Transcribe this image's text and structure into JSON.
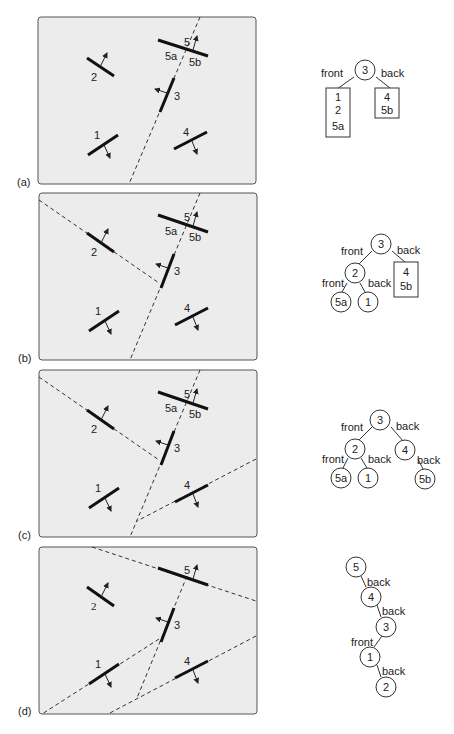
{
  "figure": {
    "panels": [
      {
        "id": "a",
        "label": "(a)",
        "wall_labels": {
          "w1": "1",
          "w2": "2",
          "w3": "3",
          "w4": "4",
          "w5": "5",
          "w5a": "5a",
          "w5b": "5b"
        },
        "tree": {
          "root": "3",
          "front_label": "front",
          "back_label": "back",
          "front_leaf": [
            "1",
            "2",
            "5a"
          ],
          "back_leaf": [
            "4",
            "5b"
          ]
        }
      },
      {
        "id": "b",
        "label": "(b)",
        "wall_labels": {
          "w1": "1",
          "w2": "2",
          "w3": "3",
          "w4": "4",
          "w5": "5",
          "w5a": "5a",
          "w5b": "5b"
        },
        "tree": {
          "root": "3",
          "n2": "2",
          "n5a": "5a",
          "n1": "1",
          "front_label": "front",
          "back_label": "back",
          "front2_label": "front",
          "back2_label": "back",
          "back_leaf": [
            "4",
            "5b"
          ]
        }
      },
      {
        "id": "c",
        "label": "(c)",
        "wall_labels": {
          "w1": "1",
          "w2": "2",
          "w3": "3",
          "w4": "4",
          "w5": "5",
          "w5a": "5a",
          "w5b": "5b"
        },
        "tree": {
          "root": "3",
          "n2": "2",
          "n4": "4",
          "n5a": "5a",
          "n1": "1",
          "n5b": "5b",
          "front_label": "front",
          "back_label": "back",
          "front2_label": "front",
          "back2_label": "back",
          "back4_label": "back"
        }
      },
      {
        "id": "d",
        "label": "(d)",
        "wall_labels": {
          "w1": "1",
          "w2": "2",
          "w3": "3",
          "w4": "4",
          "w5": "5"
        },
        "tree": {
          "n5": "5",
          "n4": "4",
          "n3": "3",
          "n1": "1",
          "n2": "2",
          "e54": "back",
          "e43": "back",
          "e31": "front",
          "e12": "back"
        }
      }
    ]
  }
}
